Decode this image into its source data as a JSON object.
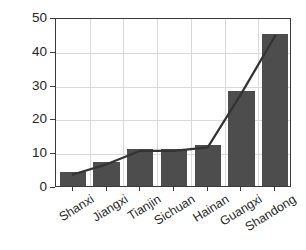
{
  "chart_data": {
    "type": "bar",
    "title": "",
    "xlabel": "",
    "ylabel": "Time interval (Month)",
    "categories": [
      "Shanxi",
      "Jiangxi",
      "Tianjin",
      "Sichuan",
      "Hainan",
      "Guangxi",
      "Shandong"
    ],
    "values": [
      4,
      7,
      11,
      11,
      12,
      28,
      45
    ],
    "series": [
      {
        "name": "Time interval",
        "type": "bar",
        "values": [
          4,
          7,
          11,
          11,
          12,
          28,
          45
        ]
      },
      {
        "name": "Trend",
        "type": "line",
        "values": [
          4,
          7,
          11,
          11,
          12,
          28,
          45
        ]
      }
    ],
    "ylim": [
      0,
      50
    ],
    "yticks": [
      0,
      10,
      20,
      30,
      40,
      50
    ],
    "ytick_labels": [
      "0",
      "10",
      "20",
      "30",
      "40",
      "50"
    ],
    "grid": true,
    "legend": "none",
    "bar_color": "#4d4d4d",
    "line_color": "#333333",
    "grid_color": "#d9d9d9",
    "axis_color": "#3b3b3b"
  }
}
